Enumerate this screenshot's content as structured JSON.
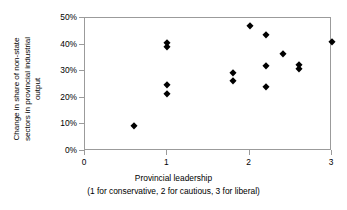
{
  "chart_data": {
    "type": "scatter",
    "title": "",
    "xlabel": "Provincial leadership",
    "xlabel_note": "(1 for conservative, 2 for cautious, 3 for liberal)",
    "ylabel": "Change in share of non-state sectors in provincial industrial output",
    "ylabel_lines": [
      "Change in share of non-state",
      "sectors in provincial industrial",
      "output"
    ],
    "xlim": [
      0,
      3
    ],
    "ylim": [
      0,
      50
    ],
    "xticks": [
      0,
      1,
      2,
      3
    ],
    "xtick_labels": [
      "0",
      "1",
      "2",
      "3"
    ],
    "yticks": [
      0,
      10,
      20,
      30,
      40,
      50
    ],
    "ytick_labels": [
      "0%",
      "10%",
      "20%",
      "30%",
      "40%",
      "50%"
    ],
    "grid": false,
    "legend": false,
    "marker": "diamond",
    "marker_color": "#000000",
    "axis_color": "#9b9b9b",
    "background_color": "#ffffff",
    "points": [
      {
        "x": 0.6,
        "y": 9.5
      },
      {
        "x": 1.0,
        "y": 40.5
      },
      {
        "x": 1.0,
        "y": 39.0
      },
      {
        "x": 1.0,
        "y": 25.0
      },
      {
        "x": 1.0,
        "y": 21.5
      },
      {
        "x": 1.8,
        "y": 29.5
      },
      {
        "x": 1.8,
        "y": 26.5
      },
      {
        "x": 2.0,
        "y": 47.0
      },
      {
        "x": 2.2,
        "y": 43.5
      },
      {
        "x": 2.2,
        "y": 32.0
      },
      {
        "x": 2.2,
        "y": 24.0
      },
      {
        "x": 2.4,
        "y": 36.5
      },
      {
        "x": 2.6,
        "y": 32.5
      },
      {
        "x": 2.6,
        "y": 31.0
      },
      {
        "x": 3.0,
        "y": 41.0
      }
    ]
  }
}
